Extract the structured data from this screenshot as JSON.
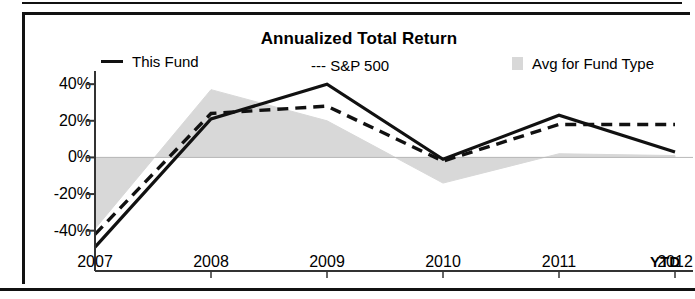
{
  "chart_data": {
    "type": "line",
    "title": "Annualized Total Return",
    "xlabel": "",
    "ylabel": "",
    "x_axis_suffix": "YTD",
    "categories": [
      "2007",
      "2008",
      "2009",
      "2010",
      "2011",
      "2012"
    ],
    "ytick_labels": [
      "40%",
      "20%",
      "0%",
      "-20%",
      "-40%"
    ],
    "yticks": [
      40,
      20,
      0,
      -20,
      -40
    ],
    "ylim": [
      -50,
      45
    ],
    "grid": false,
    "legend_position": "top",
    "series": [
      {
        "name": "This Fund",
        "style": "solid",
        "color": "#111111",
        "values": [
          -49,
          21,
          40,
          -1,
          23,
          3
        ]
      },
      {
        "name": "S&P 500",
        "style": "dashed",
        "color": "#111111",
        "values": [
          -42,
          24,
          28,
          -2,
          18,
          18
        ]
      },
      {
        "name": "Avg for Fund Type",
        "style": "area",
        "color": "#d8d8d8",
        "values": [
          -39,
          37,
          20,
          -14,
          2,
          1
        ]
      }
    ]
  },
  "legend": {
    "items": [
      {
        "label": "This Fund",
        "swatch": "solid-line-swatch"
      },
      {
        "label": "--- S&P 500",
        "swatch": "dashed-line-swatch"
      },
      {
        "label": "Avg for Fund Type",
        "swatch": "area-fill-swatch"
      }
    ]
  }
}
